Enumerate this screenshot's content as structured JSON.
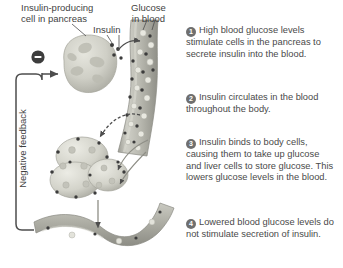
{
  "diagram": {
    "background": "#ffffff",
    "labels": {
      "pancreas_cell": "Insulin-producing\ncell in pancreas",
      "glucose": "Glucose\nin blood",
      "insulin": "Insulin",
      "negative_feedback": "Negative feedback"
    },
    "steps": [
      {
        "num": "1",
        "text": "High blood glucose levels stimulate cells in the pancreas to secrete insulin into the blood."
      },
      {
        "num": "2",
        "text": "Insulin circulates in the blood throughout the body."
      },
      {
        "num": "3",
        "text": "Insulin binds to body cells, causing them to take up glucose and liver cells to store glucose. This lowers glucose levels in the blood."
      },
      {
        "num": "4",
        "text": "Lowered blood glucose levels do not stimulate secretion of insulin."
      }
    ],
    "symbols": {
      "inhibition": "−"
    },
    "colors": {
      "badge": "#6f6f6f",
      "text": "#4a4a4a",
      "line": "#4d4d4d",
      "vessel_fill": "#b4b4ad",
      "cell_fill": "#d2d2c9",
      "insulin_dot": "#3c3c3c",
      "glucose_dot": "#e2e2da"
    }
  }
}
